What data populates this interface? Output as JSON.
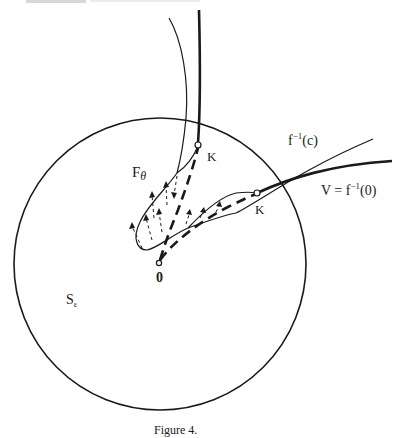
{
  "figure": {
    "caption": "Figure 4.",
    "labels": {
      "f_theta": {
        "base": "F",
        "sub": "θ"
      },
      "k_upper": "K",
      "k_lower": "K",
      "origin": "0",
      "fiber_c": {
        "base": "f",
        "sup": "−1",
        "arg": "(c)"
      },
      "variety_v": {
        "prefix": "V = f",
        "sup": "−1",
        "arg": "(0)"
      },
      "sphere": {
        "base": "S",
        "sub": "ε"
      }
    },
    "colors": {
      "ink": "#1a1a1a",
      "background": "#ffffff"
    },
    "sphere": {
      "cx": 160,
      "cy": 264,
      "r": 146
    }
  }
}
